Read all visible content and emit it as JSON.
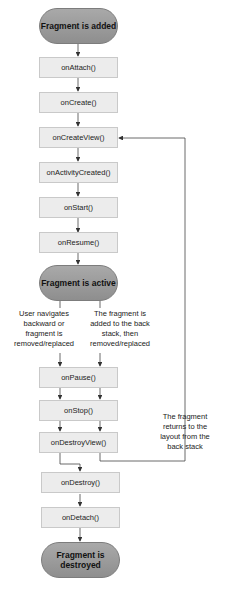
{
  "diagram": {
    "states": {
      "added": "Fragment is added",
      "active": "Fragment is active",
      "destroyed": "Fragment is destroyed"
    },
    "callbacks": {
      "onAttach": "onAttach()",
      "onCreate": "onCreate()",
      "onCreateView": "onCreateView()",
      "onActivityCreated": "onActivityCreated()",
      "onStart": "onStart()",
      "onResume": "onResume()",
      "onPause": "onPause()",
      "onStop": "onStop()",
      "onDestroyView": "onDestroyView()",
      "onDestroy": "onDestroy()",
      "onDetach": "onDetach()"
    },
    "notes": {
      "left_branch": [
        "User navigates",
        "backward or",
        "fragment is",
        "removed/replaced"
      ],
      "right_branch": [
        "The fragment is",
        "added to the back",
        "stack, then",
        "removed/replaced"
      ],
      "return": [
        "The fragment",
        "returns to the",
        "layout from the",
        "back stack"
      ]
    },
    "colors": {
      "state_fill": "#9a9a9a",
      "callback_fill": "#ececec",
      "callback_border": "#c9c9c9",
      "line": "#333333"
    }
  }
}
